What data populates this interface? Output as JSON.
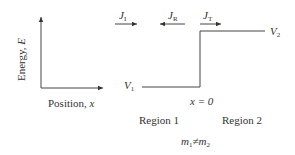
{
  "diagram": {
    "y_axis_label": "Energy, ",
    "y_axis_var": "E",
    "x_axis_label": "Position, ",
    "x_axis_var": "x",
    "currents": [
      {
        "sym": "J",
        "sub": "I",
        "direction": "right"
      },
      {
        "sym": "J",
        "sub": "R",
        "direction": "left"
      },
      {
        "sym": "J",
        "sub": "T",
        "direction": "right"
      }
    ],
    "potential_low": {
      "sym": "V",
      "sub": "1"
    },
    "potential_high": {
      "sym": "V",
      "sub": "2"
    },
    "boundary_label": "x = 0",
    "region1": "Region 1",
    "region2": "Region 2",
    "mass_relation": {
      "m1": "m",
      "sub1": "1",
      "neq": "≠",
      "m2": "m",
      "sub2": "2"
    }
  }
}
